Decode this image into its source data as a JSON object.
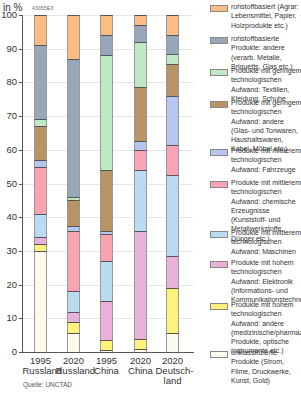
{
  "chart_data": {
    "type": "bar",
    "stacked": true,
    "title": "",
    "code": "43055EX",
    "ylabel": "in %",
    "ylim": [
      0,
      100
    ],
    "yticks": [
      0,
      10,
      20,
      30,
      40,
      50,
      60,
      70,
      80,
      90,
      100
    ],
    "grid": true,
    "legend_position": "right",
    "categories": [
      {
        "year": "1995",
        "country": "Russland"
      },
      {
        "year": "2020",
        "country": "Russland"
      },
      {
        "year": "1995",
        "country": "China"
      },
      {
        "year": "2020",
        "country": "China"
      },
      {
        "year": "2020",
        "country": "Deutsch-\nland"
      }
    ],
    "series": [
      {
        "name": "unklassifizierte Produkte (Strom, Filme, Druckwerke, Kunst, Gold)",
        "color": "#fdfbee",
        "values": [
          30,
          5.5,
          0.5,
          1,
          5.5
        ]
      },
      {
        "name": "Produkte mit hohem technologischen Aufwand: andere (medizinische/pharmazeutische Produkte, optische Instrumente etc.)",
        "color": "#fff27a",
        "values": [
          2,
          3.5,
          3,
          3,
          13.5
        ]
      },
      {
        "name": "Produkte mit hohem technologischen Aufwand: Elektronik (Informations- und Kommunikationstechnologie)",
        "color": "#eab2da",
        "values": [
          2,
          3,
          11.5,
          32,
          9.5
        ]
      },
      {
        "name": "Produkte mit mittlerem technologischen Aufwand: Maschinen",
        "color": "#b9dcf3",
        "values": [
          7,
          6,
          12,
          18,
          24
        ]
      },
      {
        "name": "Produkte mit mittlerem technologischen Aufwand: chemische Erzeugnisse (Kunststoff- und Metallwerkstoffe, Dünger etc.)",
        "color": "#f9a3b3",
        "values": [
          14,
          18,
          8,
          6,
          9
        ]
      },
      {
        "name": "Produkte mit mittlerem technologischen Aufwand: Fahrzeuge",
        "color": "#b7c6f0",
        "values": [
          2,
          1.5,
          1,
          2.5,
          14.5
        ]
      },
      {
        "name": "Produkte mit geringem technologischen Aufwand: andere (Glas- und Tonwaren, Haushaltswaren, Kabel, Möbel etc.)",
        "color": "#b89465",
        "values": [
          10,
          7.5,
          18,
          16,
          9.5
        ]
      },
      {
        "name": "Produkte mit geringem technologischen Aufwand: Textilien, Kleidung, Schuhe",
        "color": "#bfe8c4",
        "values": [
          2,
          1,
          34,
          13.5,
          3
        ]
      },
      {
        "name": "rohstoffbasierte Produkte: andere (verarb. Metalle, Briquetts, Glas etc.)",
        "color": "#97a6b8",
        "values": [
          22,
          41,
          6,
          5,
          5.5
        ]
      },
      {
        "name": "rohstoffbasiert (Agrar: Lebensmittel, Papier, Holzprodukte etc.)",
        "color": "#fbbd84",
        "values": [
          9,
          13,
          6,
          3,
          6
        ]
      }
    ],
    "source": "Quelle: UNCTAD"
  },
  "header": {
    "unit": "in %",
    "code": "43055EX"
  },
  "axis": {
    "ticks": [
      "0",
      "10",
      "20",
      "30",
      "40",
      "50",
      "60",
      "70",
      "80",
      "90",
      "100"
    ]
  },
  "xlabels": [
    {
      "year": "1995",
      "country": "Russland"
    },
    {
      "year": "2020",
      "country": "Russland"
    },
    {
      "year": "1995",
      "country": "China"
    },
    {
      "year": "2020",
      "country": "China"
    },
    {
      "year": "2020",
      "country": "Deutsch-",
      "country2": "land"
    }
  ],
  "legend": [
    {
      "label": "rohstoffbasiert (Agrar: Lebensmittel, Papier, Holzprodukte etc.)",
      "color": "#fbbd84"
    },
    {
      "label": "rohstoffbasierte Produkte: andere (verarb. Metalle, Briquetts, Glas etc.)",
      "color": "#97a6b8"
    },
    {
      "label": "Produkte mit geringem technologischen Aufwand: Textilien, Kleidung, Schuhe",
      "color": "#bfe8c4"
    },
    {
      "label": "Produkte mit geringem technologischen Aufwand: andere (Glas- und Tonwaren, Haushaltswaren, Kabel, Möbel etc.)",
      "color": "#b89465"
    },
    {
      "label": "Produkte mit mittlerem technologischen Aufwand: Fahrzeuge",
      "color": "#b7c6f0"
    },
    {
      "label": "Produkte mit mittlerem technologischen Aufwand: chemische Erzeugnisse (Kunststoff- und Metallwerkstoffe, Dünger etc.)",
      "color": "#f9a3b3"
    },
    {
      "label": "Produkte mit mittlerem technologischen Aufwand: Maschinen",
      "color": "#b9dcf3"
    },
    {
      "label": "Produkte mit hohem technologischen Aufwand: Elektronik (Informations- und Kommunikationstechnologie)",
      "color": "#eab2da"
    },
    {
      "label": "Produkte mit hohem technologischen Aufwand: andere (medizinische/pharmazeutische Produkte, optische Instrumente etc.)",
      "color": "#fff27a"
    },
    {
      "label": "unklassifizierte Produkte (Strom, Filme, Druckwerke, Kunst, Gold)",
      "color": "#fdfbee"
    }
  ],
  "source": "Quelle: UNCTAD"
}
